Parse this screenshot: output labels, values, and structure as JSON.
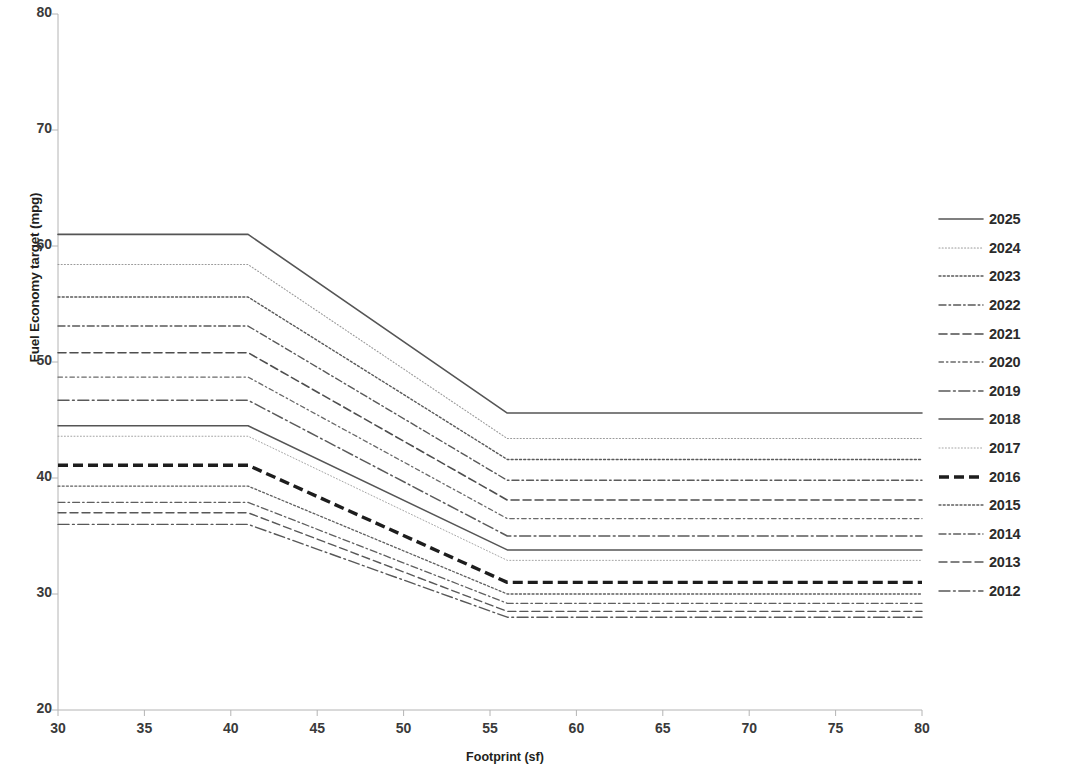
{
  "chart_data": {
    "type": "line",
    "title": "",
    "xlabel": "Footprint (sf)",
    "ylabel": "Fuel Economy target (mpg)",
    "xlim": [
      30,
      80
    ],
    "ylim": [
      20,
      80
    ],
    "xticks": [
      30,
      35,
      40,
      45,
      50,
      55,
      60,
      65,
      70,
      75,
      80
    ],
    "yticks": [
      20,
      30,
      40,
      50,
      60,
      70,
      80
    ],
    "grid": false,
    "legend_position": "right",
    "breakpoints": {
      "lower": 41,
      "upper": 56
    },
    "series": [
      {
        "name": "2025",
        "x": [
          30,
          41,
          56,
          80
        ],
        "values": [
          61.0,
          61.0,
          45.6,
          45.6
        ],
        "dash": "solid",
        "width": 1.6,
        "color": "#555555"
      },
      {
        "name": "2024",
        "x": [
          30,
          41,
          56,
          80
        ],
        "values": [
          58.4,
          58.4,
          43.4,
          43.4
        ],
        "dash": "fine-dot",
        "width": 1.1,
        "color": "#9a9a9a"
      },
      {
        "name": "2023",
        "x": [
          30,
          41,
          56,
          80
        ],
        "values": [
          55.6,
          55.6,
          41.6,
          41.6
        ],
        "dash": "dot",
        "width": 1.4,
        "color": "#5a5a5a"
      },
      {
        "name": "2022",
        "x": [
          30,
          41,
          56,
          80
        ],
        "values": [
          53.1,
          53.1,
          39.8,
          39.8
        ],
        "dash": "dash-dot",
        "width": 1.4,
        "color": "#5a5a5a"
      },
      {
        "name": "2021",
        "x": [
          30,
          41,
          56,
          80
        ],
        "values": [
          50.8,
          50.8,
          38.1,
          38.1
        ],
        "dash": "dash",
        "width": 1.6,
        "color": "#4e4e4e"
      },
      {
        "name": "2020",
        "x": [
          30,
          41,
          56,
          80
        ],
        "values": [
          48.7,
          48.7,
          36.5,
          36.5
        ],
        "dash": "dash-dot-fine",
        "width": 1.3,
        "color": "#6a6a6a"
      },
      {
        "name": "2019",
        "x": [
          30,
          41,
          56,
          80
        ],
        "values": [
          46.7,
          46.7,
          35.0,
          35.0
        ],
        "dash": "long-dash-dot",
        "width": 1.5,
        "color": "#5a5a5a"
      },
      {
        "name": "2018",
        "x": [
          30,
          41,
          56,
          80
        ],
        "values": [
          44.5,
          44.5,
          33.8,
          33.8
        ],
        "dash": "solid",
        "width": 1.5,
        "color": "#555555"
      },
      {
        "name": "2017",
        "x": [
          30,
          41,
          56,
          80
        ],
        "values": [
          43.6,
          43.6,
          32.9,
          32.9
        ],
        "dash": "fine-dot",
        "width": 1.0,
        "color": "#a5a5a5"
      },
      {
        "name": "2016",
        "x": [
          30,
          41,
          56,
          80
        ],
        "values": [
          41.1,
          41.1,
          31.0,
          31.0
        ],
        "dash": "heavy-dash",
        "width": 3.4,
        "color": "#1d1d1d"
      },
      {
        "name": "2015",
        "x": [
          30,
          41,
          56,
          80
        ],
        "values": [
          39.3,
          39.3,
          30.0,
          30.0
        ],
        "dash": "dot",
        "width": 1.3,
        "color": "#5f5f5f"
      },
      {
        "name": "2014",
        "x": [
          30,
          41,
          56,
          80
        ],
        "values": [
          37.9,
          37.9,
          29.2,
          29.2
        ],
        "dash": "dash-dot",
        "width": 1.3,
        "color": "#5f5f5f"
      },
      {
        "name": "2013",
        "x": [
          30,
          41,
          56,
          80
        ],
        "values": [
          37.0,
          37.0,
          28.5,
          28.5
        ],
        "dash": "dash",
        "width": 1.4,
        "color": "#585858"
      },
      {
        "name": "2012",
        "x": [
          30,
          41,
          56,
          80
        ],
        "values": [
          36.0,
          36.0,
          28.0,
          28.0
        ],
        "dash": "long-dash-dot",
        "width": 1.4,
        "color": "#585858"
      }
    ]
  },
  "legend": {
    "entries": [
      {
        "label": "2025"
      },
      {
        "label": "2024"
      },
      {
        "label": "2023"
      },
      {
        "label": "2022"
      },
      {
        "label": "2021"
      },
      {
        "label": "2020"
      },
      {
        "label": "2019"
      },
      {
        "label": "2018"
      },
      {
        "label": "2017"
      },
      {
        "label": "2016"
      },
      {
        "label": "2015"
      },
      {
        "label": "2014"
      },
      {
        "label": "2013"
      },
      {
        "label": "2012"
      }
    ]
  },
  "credit": {
    "text": "Reprinted with permission from Ref. [3-72]. National Highway Traffic Safety Adminitration"
  },
  "colors": {
    "axis": "#b4b4b4",
    "tick_text": "#3a3a3a",
    "title_text": "#231f20",
    "credit_text": "#4a4a4a",
    "background": "#ffffff"
  }
}
